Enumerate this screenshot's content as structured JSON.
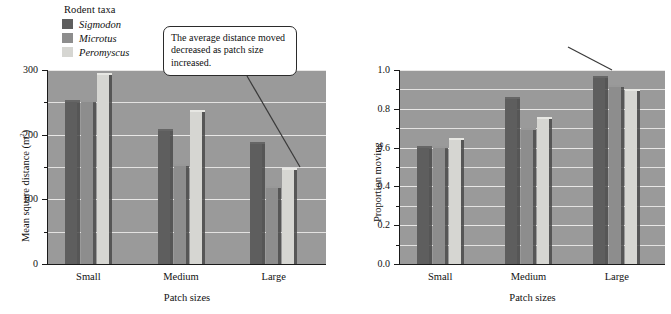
{
  "legend": {
    "title": "Rodent taxa",
    "items": [
      {
        "label": "Sigmodon",
        "color": "#5e5e5e"
      },
      {
        "label": "Microtus",
        "color": "#8d8d8d"
      },
      {
        "label": "Peromyscus",
        "color": "#d6d6d2"
      }
    ]
  },
  "callouts": {
    "left": "The average distance moved decreased as patch size increased.",
    "right": "However, the proportion of individuals moving increased as patch size increased."
  },
  "axis": {
    "x_title": "Patch sizes",
    "categories": [
      "Small",
      "Medium",
      "Large"
    ],
    "left_y_title_text": "Mean square distance (m",
    "left_y_title_sup": "2",
    "left_y_title_tail": ")",
    "right_y_title": "Proportion moving",
    "left_ticks": [
      "0",
      "100",
      "200",
      "300"
    ],
    "right_ticks": [
      "0.0",
      "0.2",
      "0.4",
      "0.6",
      "0.8",
      "1.0"
    ]
  },
  "colors": {
    "plot_background": "#9a9a9a",
    "gridline": "#f2f1ef",
    "axis": "#1a1a1a",
    "callout_border": "#2b2b2b",
    "leader_line": "#3a3a3a"
  },
  "chart_data": [
    {
      "type": "bar",
      "title": "",
      "xlabel": "Patch sizes",
      "ylabel": "Mean square distance (m2)",
      "categories": [
        "Small",
        "Medium",
        "Large"
      ],
      "ylim": [
        0,
        300
      ],
      "yticks": [
        0,
        100,
        200,
        300
      ],
      "yticks_minor": [
        50,
        150,
        250
      ],
      "grid": true,
      "legend_position": "outside-top-left",
      "annotation": "The average distance moved decreased as patch size increased.",
      "series": [
        {
          "name": "Sigmodon",
          "color": "#5e5e5e",
          "values": [
            250,
            205,
            185
          ]
        },
        {
          "name": "Microtus",
          "color": "#8d8d8d",
          "values": [
            250,
            152,
            117
          ]
        },
        {
          "name": "Peromyscus",
          "color": "#d6d6d2",
          "values": [
            292,
            235,
            145
          ]
        }
      ]
    },
    {
      "type": "bar",
      "title": "",
      "xlabel": "Patch sizes",
      "ylabel": "Proportion moving",
      "categories": [
        "Small",
        "Medium",
        "Large"
      ],
      "ylim": [
        0,
        1.0
      ],
      "yticks": [
        0.0,
        0.2,
        0.4,
        0.6,
        0.8,
        1.0
      ],
      "yticks_minor": [
        0.1,
        0.3,
        0.5,
        0.7,
        0.9
      ],
      "grid": true,
      "legend_position": "shared-with-left-panel",
      "annotation": "However, the proportion of individuals moving increased as patch size increased.",
      "series": [
        {
          "name": "Sigmodon",
          "color": "#5e5e5e",
          "values": [
            0.6,
            0.85,
            0.96
          ]
        },
        {
          "name": "Microtus",
          "color": "#8d8d8d",
          "values": [
            0.6,
            0.69,
            0.91
          ]
        },
        {
          "name": "Peromyscus",
          "color": "#d6d6d2",
          "values": [
            0.64,
            0.75,
            0.89
          ]
        }
      ]
    }
  ]
}
